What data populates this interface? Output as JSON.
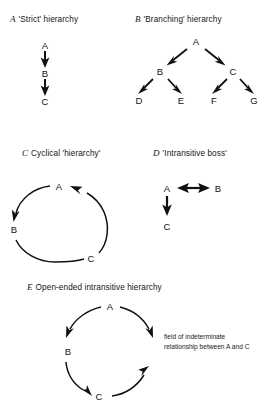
{
  "figure": {
    "background_color": "#ffffff",
    "ink_color": "#111111",
    "panels": [
      {
        "id": "A",
        "tag": "A",
        "title": "'Strict' hierarchy",
        "nodes": [
          "A",
          "B",
          "C"
        ],
        "relations": [
          "A → B",
          "B → C"
        ]
      },
      {
        "id": "B",
        "tag": "B",
        "title": "'Branching' hierarchy",
        "nodes": [
          "A",
          "B",
          "C",
          "D",
          "E",
          "F",
          "G"
        ],
        "relations": [
          "A → B",
          "A → C",
          "B → D",
          "B → E",
          "C → F",
          "C → G"
        ]
      },
      {
        "id": "C",
        "tag": "C",
        "title": "Cyclical 'hierarchy'",
        "nodes": [
          "A",
          "B",
          "C"
        ],
        "relations": [
          "A → B",
          "B → C",
          "C → A"
        ]
      },
      {
        "id": "D",
        "tag": "D",
        "title": "'Intransitive boss'",
        "nodes": [
          "A",
          "B",
          "C"
        ],
        "relations": [
          "A ↔ B",
          "A → C"
        ]
      },
      {
        "id": "E",
        "tag": "E",
        "title": "Open-ended intransitive hierarchy",
        "nodes": [
          "A",
          "B",
          "C"
        ],
        "relations": [
          "A → B",
          "B → C",
          "A → (open)",
          "C → (open)"
        ],
        "caption": "field of indeterminate relationship between A and C"
      }
    ],
    "labels": {
      "panel_a": {
        "tag": "A",
        "title": "'Strict' hierarchy",
        "node_1": "A",
        "node_2": "B",
        "node_3": "C"
      },
      "panel_b": {
        "tag": "B",
        "title": "'Branching' hierarchy",
        "node_a": "A",
        "node_b": "B",
        "node_c": "C",
        "node_d": "D",
        "node_e": "E",
        "node_f": "F",
        "node_g": "G"
      },
      "panel_c": {
        "tag": "C",
        "title": "Cyclical 'hierarchy'",
        "node_a": "A",
        "node_b": "B",
        "node_c": "C"
      },
      "panel_d": {
        "tag": "D",
        "title": "'Intransitive boss'",
        "node_a": "A",
        "node_b": "B",
        "node_c": "C"
      },
      "panel_e": {
        "tag": "E",
        "title": "Open-ended intransitive hierarchy",
        "node_a": "A",
        "node_b": "B",
        "node_c": "C",
        "caption": "field of indeterminate relationship between A and C"
      }
    }
  }
}
